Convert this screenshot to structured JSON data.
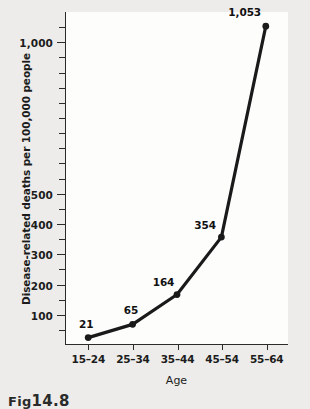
{
  "figure": {
    "caption_prefix": "Fig",
    "caption_number": "14.8"
  },
  "chart_data": {
    "type": "line",
    "title": "",
    "xlabel": "Age",
    "ylabel": "Disease-related deaths per 100,000 people",
    "categories": [
      "15–24",
      "25–34",
      "35–44",
      "45–54",
      "55–64"
    ],
    "values": [
      21,
      65,
      164,
      354,
      1053
    ],
    "point_labels": [
      "21",
      "65",
      "164",
      "354",
      "1,053"
    ],
    "ylim": [
      0,
      1100
    ],
    "ytick_values": [
      100,
      200,
      300,
      400,
      500,
      1000
    ],
    "ytick_labels": [
      "100",
      "200",
      "300",
      "400",
      "500",
      "1,000"
    ],
    "yminor_step": 50,
    "grid": false,
    "legend": "none",
    "line_color": "#1a1a1a",
    "marker_color": "#1a1a1a",
    "plot_background": "#fdfdfc",
    "page_background": "#edecea"
  }
}
